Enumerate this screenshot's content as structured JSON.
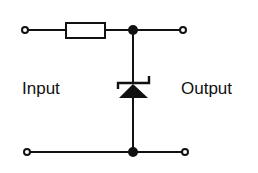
{
  "diagram": {
    "type": "circuit-schematic",
    "labels": {
      "input": "Input",
      "output": "Output"
    },
    "components": [
      {
        "id": "R1",
        "kind": "resistor",
        "icon": "resistor-icon",
        "position": "series, top rail"
      },
      {
        "id": "D1",
        "kind": "zener-diode",
        "icon": "zener-diode-icon",
        "position": "shunt, between top and bottom rail",
        "orientation": "cathode up"
      }
    ],
    "terminals": [
      {
        "id": "input-top",
        "icon": "open-terminal-icon"
      },
      {
        "id": "input-bottom",
        "icon": "open-terminal-icon"
      },
      {
        "id": "output-top",
        "icon": "open-terminal-icon"
      },
      {
        "id": "output-bottom",
        "icon": "open-terminal-icon"
      }
    ],
    "junctions": [
      {
        "id": "top-junction",
        "icon": "junction-dot-icon"
      },
      {
        "id": "bottom-junction",
        "icon": "junction-dot-icon"
      }
    ],
    "colors": {
      "stroke": "#111111",
      "background": "#ffffff"
    }
  }
}
